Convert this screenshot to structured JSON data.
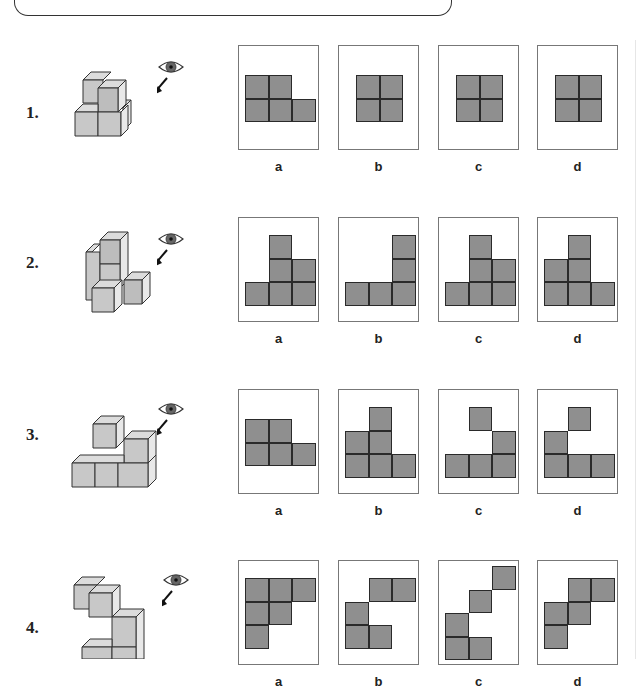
{
  "colors": {
    "cell_fill": "#8f8f8f",
    "cell_border": "#2a2a2a",
    "frame_border": "#777777",
    "cube_front": "#c8c8c8",
    "cube_top": "#dcdcdc",
    "cube_side": "#e8e8e8",
    "eye_iris": "#555555"
  },
  "questions": [
    {
      "number": "1.",
      "options": [
        {
          "label": "a",
          "ox": 6,
          "oy": 29,
          "cells": [
            [
              0,
              0
            ],
            [
              0,
              1
            ],
            [
              1,
              0
            ],
            [
              1,
              1
            ],
            [
              1,
              2
            ]
          ]
        },
        {
          "label": "b",
          "ox": 17,
          "oy": 29,
          "cells": [
            [
              0,
              0
            ],
            [
              0,
              1
            ],
            [
              1,
              0
            ],
            [
              1,
              1
            ]
          ]
        },
        {
          "label": "c",
          "ox": 17,
          "oy": 29,
          "cells": [
            [
              0,
              0
            ],
            [
              0,
              1
            ],
            [
              1,
              0
            ],
            [
              1,
              1
            ]
          ]
        },
        {
          "label": "d",
          "ox": 17,
          "oy": 29,
          "cells": [
            [
              0,
              0
            ],
            [
              0,
              1
            ],
            [
              1,
              0
            ],
            [
              1,
              1
            ]
          ]
        }
      ]
    },
    {
      "number": "2.",
      "options": [
        {
          "label": "a",
          "ox": 6,
          "oy": 17,
          "cells": [
            [
              0,
              1
            ],
            [
              1,
              1
            ],
            [
              1,
              2
            ],
            [
              2,
              0
            ],
            [
              2,
              1
            ],
            [
              2,
              2
            ]
          ]
        },
        {
          "label": "b",
          "ox": 6,
          "oy": 17,
          "cells": [
            [
              0,
              2
            ],
            [
              1,
              2
            ],
            [
              2,
              0
            ],
            [
              2,
              1
            ],
            [
              2,
              2
            ]
          ]
        },
        {
          "label": "c",
          "ox": 6,
          "oy": 17,
          "cells": [
            [
              0,
              1
            ],
            [
              1,
              1
            ],
            [
              1,
              2
            ],
            [
              2,
              0
            ],
            [
              2,
              1
            ],
            [
              2,
              2
            ]
          ]
        },
        {
          "label": "d",
          "ox": 6,
          "oy": 17,
          "cells": [
            [
              0,
              1
            ],
            [
              1,
              0
            ],
            [
              1,
              1
            ],
            [
              2,
              0
            ],
            [
              2,
              1
            ],
            [
              2,
              2
            ]
          ]
        }
      ]
    },
    {
      "number": "3.",
      "options": [
        {
          "label": "a",
          "ox": 6,
          "oy": 29,
          "cells": [
            [
              0,
              0
            ],
            [
              0,
              1
            ],
            [
              1,
              0
            ],
            [
              1,
              1
            ],
            [
              1,
              2
            ]
          ]
        },
        {
          "label": "b",
          "ox": 6,
          "oy": 17,
          "cells": [
            [
              0,
              1
            ],
            [
              1,
              0
            ],
            [
              1,
              1
            ],
            [
              2,
              0
            ],
            [
              2,
              1
            ],
            [
              2,
              2
            ]
          ]
        },
        {
          "label": "c",
          "ox": 6,
          "oy": 17,
          "cells": [
            [
              0,
              1
            ],
            [
              1,
              2
            ],
            [
              2,
              0
            ],
            [
              2,
              1
            ],
            [
              2,
              2
            ]
          ]
        },
        {
          "label": "d",
          "ox": 6,
          "oy": 17,
          "cells": [
            [
              0,
              1
            ],
            [
              1,
              0
            ],
            [
              2,
              0
            ],
            [
              2,
              1
            ],
            [
              2,
              2
            ]
          ]
        }
      ]
    },
    {
      "number": "4.",
      "options": [
        {
          "label": "a",
          "ox": 6,
          "oy": 17,
          "cells": [
            [
              0,
              0
            ],
            [
              0,
              1
            ],
            [
              0,
              2
            ],
            [
              1,
              0
            ],
            [
              1,
              1
            ],
            [
              2,
              0
            ]
          ]
        },
        {
          "label": "b",
          "ox": 6,
          "oy": 17,
          "cells": [
            [
              0,
              1
            ],
            [
              0,
              2
            ],
            [
              1,
              0
            ],
            [
              2,
              0
            ],
            [
              2,
              1
            ]
          ]
        },
        {
          "label": "c",
          "ox": 6,
          "oy": 5,
          "cells": [
            [
              0,
              2
            ],
            [
              1,
              1
            ],
            [
              2,
              0
            ],
            [
              3,
              0
            ],
            [
              3,
              1
            ]
          ]
        },
        {
          "label": "d",
          "ox": 6,
          "oy": 17,
          "cells": [
            [
              0,
              1
            ],
            [
              0,
              2
            ],
            [
              1,
              0
            ],
            [
              1,
              1
            ],
            [
              2,
              0
            ]
          ]
        }
      ]
    }
  ]
}
